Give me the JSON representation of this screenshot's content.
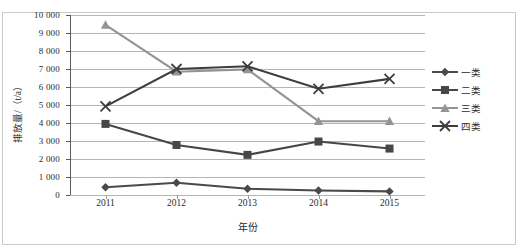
{
  "chart_data": {
    "type": "line",
    "title": "",
    "xlabel": "年份",
    "ylabel": "排放量/（t/a）",
    "categories": [
      "2011",
      "2012",
      "2013",
      "2014",
      "2015"
    ],
    "ylim": [
      0,
      10000
    ],
    "ytick_step": 1000,
    "ytick_labels": [
      "10 000",
      "9 000",
      "8 000",
      "7 000",
      "6 000",
      "5 000",
      "4 000",
      "3 000",
      "2 000",
      "1 000",
      "0"
    ],
    "ytick_values": [
      10000,
      9000,
      8000,
      7000,
      6000,
      5000,
      4000,
      3000,
      2000,
      1000,
      0
    ],
    "grid": true,
    "legend_position": "right",
    "series": [
      {
        "name": "一类",
        "marker": "diamond",
        "color": "#4a4a4a",
        "values": [
          430,
          680,
          350,
          250,
          200
        ]
      },
      {
        "name": "二类",
        "marker": "square",
        "color": "#474747",
        "values": [
          3950,
          2780,
          2230,
          2970,
          2580
        ]
      },
      {
        "name": "三类",
        "marker": "triangle",
        "color": "#949494",
        "values": [
          9450,
          6850,
          6980,
          4100,
          4100
        ]
      },
      {
        "name": "四类",
        "marker": "cross",
        "color": "#3d3d3d",
        "values": [
          4920,
          7000,
          7150,
          5900,
          6450
        ]
      }
    ]
  },
  "legend": {
    "items": [
      {
        "label": "一类"
      },
      {
        "label": "二类"
      },
      {
        "label": "三类"
      },
      {
        "label": "四类"
      }
    ]
  },
  "axes": {
    "x_title": "年份",
    "y_title": "排放量/（t/a）"
  }
}
